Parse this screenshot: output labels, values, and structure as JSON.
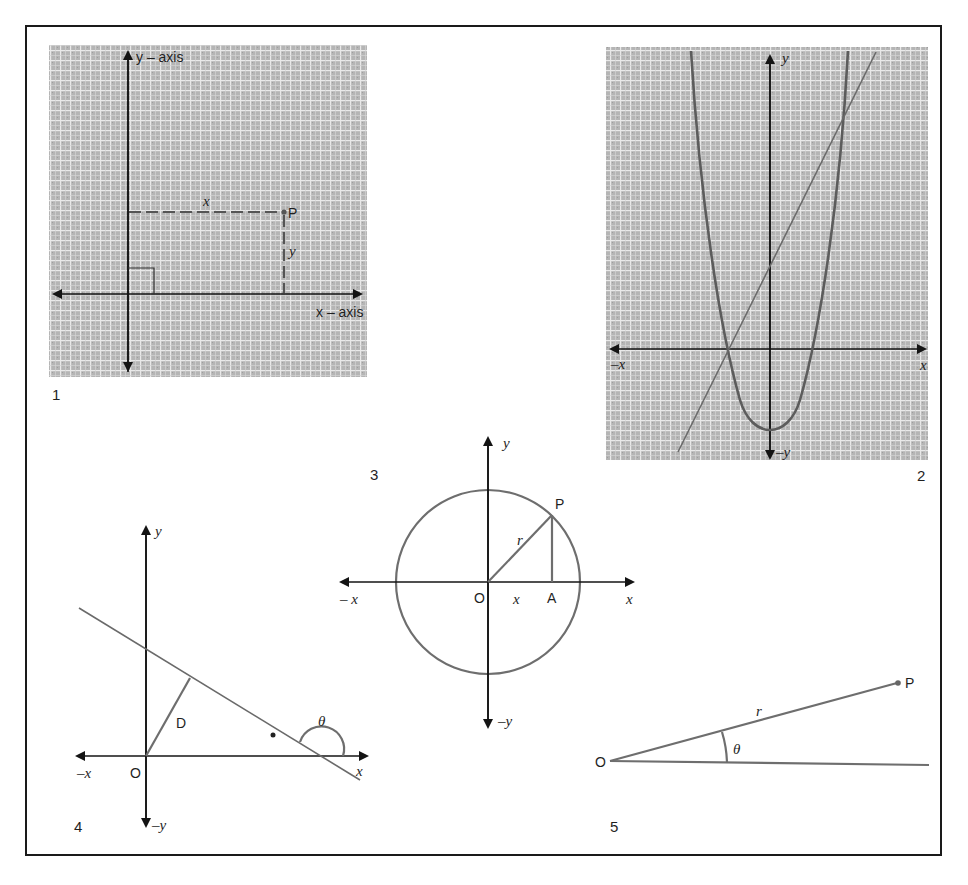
{
  "page": {
    "header_fragment": "(partially cropped text at top of page)"
  },
  "colors": {
    "grid_background": "#b9b9b9",
    "grid_line": "#efefef",
    "axis": "#141414",
    "curve": "#5c5c5c",
    "frame": "#1a1a1a"
  },
  "diagram1": {
    "number": "1",
    "y_axis_label": "y – axis",
    "x_axis_label": "x – axis",
    "point_label": "P",
    "x_distance_label": "x",
    "y_distance_label": "y"
  },
  "diagram2": {
    "number": "2",
    "y_label": "y",
    "neg_y_label": "–y",
    "x_label": "x",
    "neg_x_label": "–x"
  },
  "diagram3": {
    "number": "3",
    "y_label": "y",
    "neg_y_label": "–y",
    "x_label": "x",
    "neg_x_label": "– x",
    "origin_label": "O",
    "point_label": "P",
    "foot_label": "A",
    "radius_label": "r",
    "segment_label": "x"
  },
  "diagram4": {
    "number": "4",
    "y_label": "y",
    "neg_y_label": "–y",
    "x_label": "x",
    "neg_x_label": "–x",
    "origin_label": "O",
    "distance_label": "D",
    "angle_label": "θ"
  },
  "diagram5": {
    "number": "5",
    "origin_label": "O",
    "point_label": "P",
    "radius_label": "r",
    "angle_label": "θ"
  }
}
